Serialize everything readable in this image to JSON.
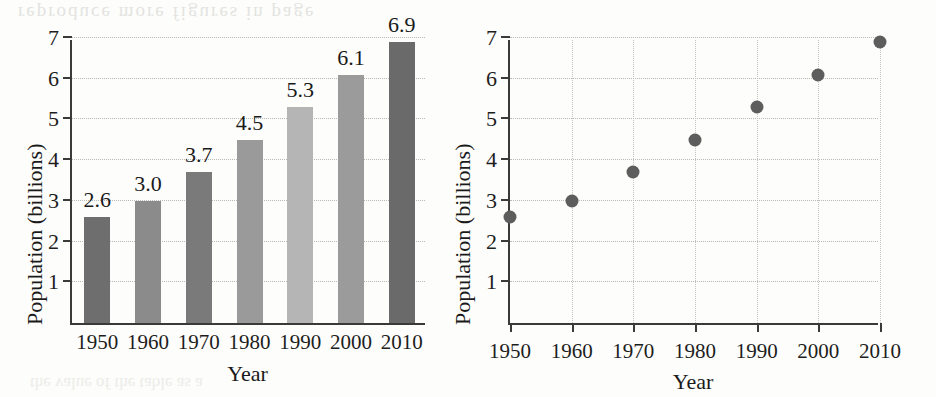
{
  "chart_data": [
    {
      "type": "bar",
      "title": "",
      "xlabel": "Year",
      "ylabel": "Population (billions)",
      "categories": [
        "1950",
        "1960",
        "1970",
        "1980",
        "1990",
        "2000",
        "2010"
      ],
      "values": [
        2.6,
        3.0,
        3.7,
        4.5,
        5.3,
        6.1,
        6.9
      ],
      "value_labels": [
        "2.6",
        "3.0",
        "3.7",
        "4.5",
        "5.3",
        "6.1",
        "6.9"
      ],
      "ylim": [
        0,
        7
      ],
      "yticks": [
        "1",
        "2",
        "3",
        "4",
        "5",
        "6",
        "7"
      ],
      "ytick_values": [
        1,
        2,
        3,
        4,
        5,
        6,
        7
      ],
      "grid": "horizontal-dotted",
      "legend": "none",
      "bar_colors": [
        "#6e6e6e",
        "#8b8b8b",
        "#7a7a7a",
        "#9a9a9a",
        "#b5b5b5",
        "#9b9b9b",
        "#6a6a6a"
      ]
    },
    {
      "type": "scatter",
      "title": "",
      "xlabel": "Year",
      "ylabel": "Population (billions)",
      "x": [
        1950,
        1960,
        1970,
        1980,
        1990,
        2000,
        2010
      ],
      "xtick_labels": [
        "1950",
        "1960",
        "1970",
        "1980",
        "1990",
        "2000",
        "2010"
      ],
      "values": [
        2.6,
        3.0,
        3.7,
        4.5,
        5.3,
        6.1,
        6.9
      ],
      "ylim": [
        0,
        7
      ],
      "yticks": [
        "1",
        "2",
        "3",
        "4",
        "5",
        "6",
        "7"
      ],
      "ytick_values": [
        1,
        2,
        3,
        4,
        5,
        6,
        7
      ],
      "grid": "both-dotted",
      "legend": "none",
      "point_color": "#5d5d5d"
    }
  ],
  "page": {
    "ghost_top": "reproduce  more  figures   in  page",
    "ghost_bottom": "the  value  of  the  table  as  a"
  }
}
